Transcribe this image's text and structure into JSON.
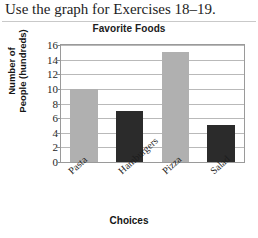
{
  "heading": "Use the graph for Exercises 18–19.",
  "chart_data": {
    "type": "bar",
    "title": "Favorite Foods",
    "xlabel": "Choices",
    "ylabel": "Number of\nPeople (hundreds)",
    "ylabel_lines": [
      "Number of",
      "People (hundreds)"
    ],
    "categories": [
      "Pasta",
      "Hamburgers",
      "Pizza",
      "Salad"
    ],
    "values": [
      10,
      7,
      15,
      5
    ],
    "yticks": [
      16,
      14,
      12,
      10,
      8,
      6,
      4,
      2,
      0
    ],
    "ylim": [
      0,
      16
    ],
    "grid": true,
    "legend": "none",
    "bar_colors": [
      "#b0b0b0",
      "#2b2b2b",
      "#b0b0b0",
      "#2b2b2b"
    ],
    "colors": {
      "light_bar": "#b0b0b0",
      "dark_bar": "#2b2b2b",
      "gridline": "#b9b9b9",
      "frame": "#9a9a9a",
      "text": "#1d1d1d"
    }
  }
}
